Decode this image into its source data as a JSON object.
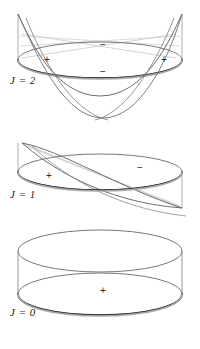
{
  "figure_title": "Nodal surfaces of spherical harmonics",
  "colors": {
    "outline": "#4a4a4a",
    "outline_light": "#9a9a9a",
    "rim_dark": "#2e2e2e",
    "surface": "#555555",
    "plane_light": "#c9c9c9",
    "sign_text": "#2b2b2b",
    "label_text": "#1a1a1a",
    "background": "#ffffff"
  },
  "panels": [
    {
      "id": "j2",
      "label": "J = 2",
      "label_x": 10,
      "label_y": 82,
      "cylinder": {
        "cx": 100,
        "cy": 60,
        "rx": 82,
        "ry": 18,
        "height": 46
      },
      "surface_type": "double-saddle",
      "signs": [
        {
          "glyph": "+",
          "x": 47,
          "y": 60
        },
        {
          "glyph": "+",
          "x": 164,
          "y": 60
        },
        {
          "glyph": "−",
          "x": 103,
          "y": 45
        },
        {
          "glyph": "−",
          "x": 103,
          "y": 72
        }
      ]
    },
    {
      "id": "j1",
      "label": "J = 1",
      "label_x": 10,
      "label_y": 196,
      "cylinder": {
        "cx": 100,
        "cy": 172,
        "rx": 82,
        "ry": 18,
        "height": 46
      },
      "surface_type": "tilted-plane",
      "signs": [
        {
          "glyph": "+",
          "x": 49,
          "y": 176
        },
        {
          "glyph": "−",
          "x": 140,
          "y": 168
        }
      ]
    },
    {
      "id": "j0",
      "label": "J = 0",
      "label_x": 10,
      "label_y": 314,
      "cylinder": {
        "cx": 100,
        "cy": 272,
        "rx": 82,
        "ry": 22,
        "height": 45
      },
      "surface_type": "none",
      "signs": [
        {
          "glyph": "+",
          "x": 103,
          "y": 291
        }
      ]
    }
  ]
}
